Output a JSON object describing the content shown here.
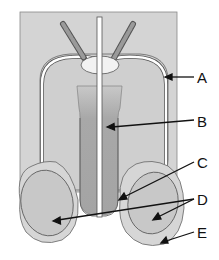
{
  "diagram": {
    "type": "anatomical-cross-section",
    "colors": {
      "background_panel": "#d4d4d4",
      "body_fill": "#cfcfcf",
      "capsule_line": "#555555",
      "duct_fill": "#ffffff",
      "core_dark": "#9a9a9a",
      "core_mid": "#b0b0b0",
      "ovoid_outer": "#d6d6d6",
      "ovoid_inner": "#c8c8c8",
      "arrow": "#111111"
    },
    "labels": [
      {
        "id": "A",
        "text": "A"
      },
      {
        "id": "B",
        "text": "B"
      },
      {
        "id": "C",
        "text": "C"
      },
      {
        "id": "D",
        "text": "D"
      },
      {
        "id": "E",
        "text": "E"
      }
    ]
  }
}
